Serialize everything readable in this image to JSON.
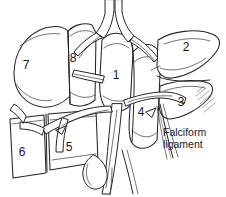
{
  "figure": {
    "background_color": "#ffffff",
    "ink_color": "#232427",
    "stipple_color": "#6d6e71",
    "width": 226,
    "height": 197
  },
  "segments": [
    {
      "id": "segment-1",
      "label": "1",
      "x": 116,
      "y": 79
    },
    {
      "id": "segment-2",
      "label": "2",
      "x": 186,
      "y": 51
    },
    {
      "id": "segment-3",
      "label": "3",
      "x": 181,
      "y": 106
    },
    {
      "id": "segment-4",
      "label": "4",
      "x": 141,
      "y": 116
    },
    {
      "id": "segment-5",
      "label": "5",
      "x": 69,
      "y": 151
    },
    {
      "id": "segment-6",
      "label": "6",
      "x": 22,
      "y": 156
    },
    {
      "id": "segment-7",
      "label": "7",
      "x": 26,
      "y": 69
    },
    {
      "id": "segment-8",
      "label": "8",
      "x": 73,
      "y": 62
    }
  ],
  "annotations": [
    {
      "id": "falciform-ligament",
      "lines": [
        "Falciform",
        "ligament"
      ],
      "x": 163,
      "y": 136
    }
  ]
}
